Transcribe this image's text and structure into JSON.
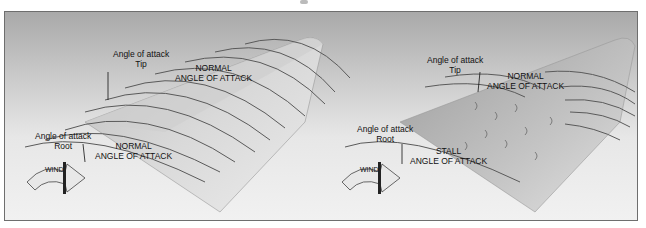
{
  "figure": {
    "left_panel": {
      "tip_label": [
        "Angle of attack",
        "Tip"
      ],
      "tip_condition": [
        "NORMAL",
        "ANGLE OF ATTACK"
      ],
      "root_label": [
        "Angle of attack",
        "Root"
      ],
      "root_condition": [
        "NORMAL",
        "ANGLE OF ATTACK"
      ],
      "wind_label": "WIND"
    },
    "right_panel": {
      "tip_label": [
        "Angle of attack",
        "Tip"
      ],
      "tip_condition": [
        "NORMAL",
        "ANGLE OF ATTACK"
      ],
      "root_label": [
        "Angle of attack",
        "Root"
      ],
      "root_condition": [
        "STALL",
        "ANGLE OF ATTACK"
      ],
      "wind_label": "WIND"
    }
  },
  "colors": {
    "frame_border": "#6e6e6e",
    "wing": "#d8d8d8",
    "streamline": "#5a5a5a",
    "text": "#111111"
  }
}
